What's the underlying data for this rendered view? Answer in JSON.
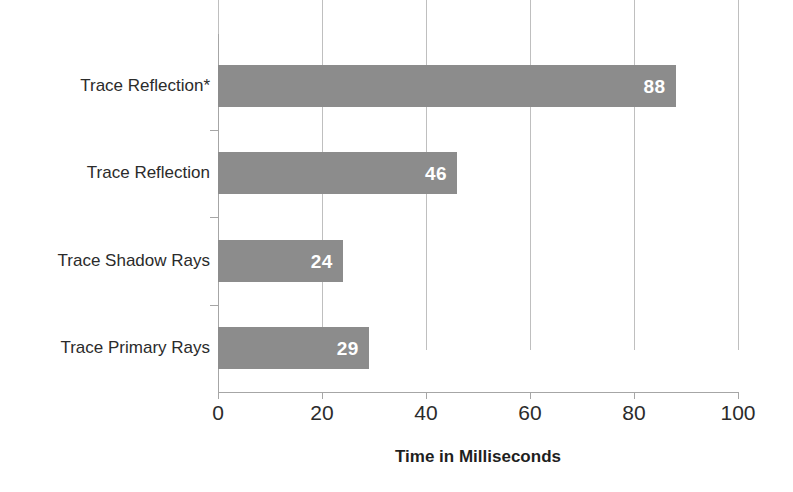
{
  "chart_data": {
    "type": "bar",
    "orientation": "horizontal",
    "title": "",
    "subtitle": "",
    "xlabel": "Time in Milliseconds",
    "ylabel": "",
    "categories": [
      "Trace Primary Rays",
      "Trace Shadow Rays",
      "Trace Reflection",
      "Trace Reflection*"
    ],
    "values": [
      29,
      24,
      46,
      88
    ],
    "bars": [
      {
        "category": "Trace Reflection*",
        "value": 88,
        "label": "88"
      },
      {
        "category": "Trace Reflection",
        "value": 46,
        "label": "46"
      },
      {
        "category": "Trace Shadow Rays",
        "value": 24,
        "label": "24"
      },
      {
        "category": "Trace Primary Rays",
        "value": 29,
        "label": "29"
      }
    ],
    "xlim": [
      0,
      100
    ],
    "xticks": [
      0,
      20,
      40,
      60,
      80,
      100
    ],
    "xtick_labels": [
      "0",
      "20",
      "40",
      "60",
      "80",
      "100"
    ],
    "grid": "vertical",
    "legend": "none",
    "bar_color": "#8c8c8c",
    "gridline_color": "#bfbfbf",
    "axis_color": "#a6a6a6",
    "value_label_color": "#ffffff",
    "background_color": "#ffffff",
    "text_color": "#2b2b2b"
  }
}
